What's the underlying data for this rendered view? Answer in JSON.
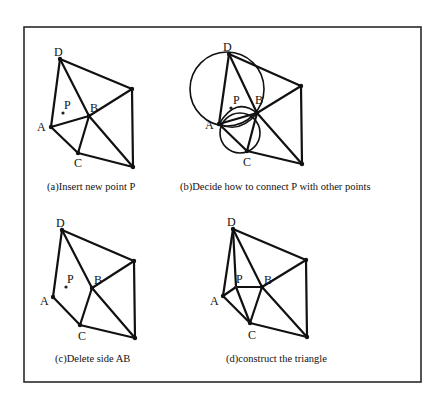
{
  "figure": {
    "frame": {
      "x": 24,
      "y": 27,
      "width": 397,
      "height": 355
    },
    "panels": [
      {
        "id": "a",
        "caption": "(a)Insert new point P",
        "caption_pos": [
          47,
          190
        ],
        "points": {
          "D": [
            60,
            59
          ],
          "E": [
            132,
            89
          ],
          "B": [
            89,
            116
          ],
          "A": [
            51,
            127
          ],
          "C": [
            78,
            153
          ],
          "F": [
            133,
            167
          ]
        },
        "new_point": [
          63,
          113
        ],
        "labels": {
          "D": {
            "text": "D",
            "pos": [
              54,
              56
            ]
          },
          "P": {
            "text": "P",
            "pos": [
              64,
              109
            ]
          },
          "B": {
            "text": "B",
            "pos": [
              90,
              112
            ]
          },
          "A": {
            "text": "A",
            "pos": [
              37,
              131
            ]
          },
          "C": {
            "text": "C",
            "pos": [
              74,
              167
            ]
          }
        },
        "edges": [
          [
            "D",
            "A"
          ],
          [
            "D",
            "B"
          ],
          [
            "D",
            "E"
          ],
          [
            "E",
            "B"
          ],
          [
            "E",
            "F"
          ],
          [
            "A",
            "B"
          ],
          [
            "A",
            "C"
          ],
          [
            "B",
            "C"
          ],
          [
            "B",
            "F"
          ],
          [
            "C",
            "F"
          ]
        ]
      },
      {
        "id": "b",
        "caption": "(b)Decide how to connect P with other points",
        "caption_pos": [
          180,
          190
        ],
        "points": {
          "D": [
            229,
            54
          ],
          "E": [
            301,
            86
          ],
          "B": [
            257,
            113
          ],
          "A": [
            219,
            124
          ],
          "C": [
            247,
            151
          ],
          "F": [
            302,
            164
          ]
        },
        "new_point": [
          231,
          108
        ],
        "labels": {
          "D": {
            "text": "D",
            "pos": [
              223,
              51
            ]
          },
          "P": {
            "text": "P",
            "pos": [
              233,
              104
            ]
          },
          "B": {
            "text": "B",
            "pos": [
              255,
              104
            ]
          },
          "A": {
            "text": "A",
            "pos": [
              205,
              129
            ]
          },
          "C": {
            "text": "C",
            "pos": [
              243,
              166
            ]
          }
        },
        "edges": [
          [
            "D",
            "A"
          ],
          [
            "D",
            "B"
          ],
          [
            "D",
            "E"
          ],
          [
            "E",
            "B"
          ],
          [
            "E",
            "F"
          ],
          [
            "A",
            "B"
          ],
          [
            "A",
            "C"
          ],
          [
            "B",
            "C"
          ],
          [
            "B",
            "F"
          ],
          [
            "C",
            "F"
          ]
        ],
        "circles": [
          {
            "name": "circumcircle-ADB",
            "cx": 227,
            "cy": 89,
            "r": 37
          },
          {
            "name": "circumcircle-ABC",
            "cx": 240,
            "cy": 133,
            "r": 20
          }
        ],
        "arcs": [
          {
            "name": "arc-A-P-B",
            "d": "M219,124 Q236,96 257,113"
          },
          {
            "name": "arc-A-B-lower",
            "d": "M219,124 Q240,134 257,113"
          }
        ]
      },
      {
        "id": "c",
        "caption": "(c)Delete side AB",
        "caption_pos": [
          55,
          362
        ],
        "points": {
          "D": [
            62,
            230
          ],
          "E": [
            134,
            261
          ],
          "B": [
            92,
            288
          ],
          "A": [
            53,
            297
          ],
          "C": [
            80,
            325
          ],
          "F": [
            135,
            338
          ]
        },
        "new_point": [
          66,
          287
        ],
        "labels": {
          "D": {
            "text": "D",
            "pos": [
              56,
              227
            ]
          },
          "P": {
            "text": "P",
            "pos": [
              67,
              283
            ]
          },
          "B": {
            "text": "B",
            "pos": [
              94,
              284
            ]
          },
          "A": {
            "text": "A",
            "pos": [
              40,
              305
            ]
          },
          "C": {
            "text": "C",
            "pos": [
              78,
              340
            ]
          }
        },
        "edges": [
          [
            "D",
            "A"
          ],
          [
            "D",
            "B"
          ],
          [
            "D",
            "E"
          ],
          [
            "E",
            "B"
          ],
          [
            "E",
            "F"
          ],
          [
            "A",
            "C"
          ],
          [
            "B",
            "C"
          ],
          [
            "B",
            "F"
          ],
          [
            "C",
            "F"
          ]
        ]
      },
      {
        "id": "d",
        "caption": "(d)construct the triangle",
        "caption_pos": [
          226,
          362
        ],
        "points": {
          "D": [
            233,
            229
          ],
          "E": [
            306,
            260
          ],
          "B": [
            262,
            287
          ],
          "A": [
            223,
            296
          ],
          "C": [
            250,
            323
          ],
          "F": [
            307,
            337
          ]
        },
        "new_point": [
          236,
          287
        ],
        "labels": {
          "D": {
            "text": "D",
            "pos": [
              227,
              226
            ]
          },
          "P": {
            "text": "P",
            "pos": [
              236,
              283
            ]
          },
          "B": {
            "text": "B",
            "pos": [
              264,
              284
            ]
          },
          "A": {
            "text": "A",
            "pos": [
              210,
              305
            ]
          },
          "C": {
            "text": "C",
            "pos": [
              248,
              339
            ]
          }
        },
        "edges": [
          [
            "D",
            "A"
          ],
          [
            "D",
            "P"
          ],
          [
            "D",
            "B"
          ],
          [
            "D",
            "E"
          ],
          [
            "E",
            "B"
          ],
          [
            "E",
            "F"
          ],
          [
            "P",
            "B"
          ],
          [
            "A",
            "P"
          ],
          [
            "P",
            "C"
          ],
          [
            "A",
            "C"
          ],
          [
            "B",
            "C"
          ],
          [
            "B",
            "F"
          ],
          [
            "C",
            "F"
          ]
        ]
      }
    ]
  }
}
